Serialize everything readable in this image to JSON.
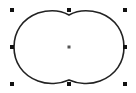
{
  "canvas": {
    "width": 136,
    "height": 93,
    "background": "#ffffff"
  },
  "shape": {
    "type": "union-of-two-circles",
    "stroke": "#222222",
    "stroke_width": 1.6,
    "fill": "#ffffff"
  },
  "selection": {
    "handle_color": "#111111",
    "handle_size": 4,
    "handles": [
      {
        "name": "top-left",
        "x": 12,
        "y": 10
      },
      {
        "name": "top-middle",
        "x": 69,
        "y": 10
      },
      {
        "name": "top-right",
        "x": 125,
        "y": 10
      },
      {
        "name": "middle-left",
        "x": 12,
        "y": 47
      },
      {
        "name": "middle-right",
        "x": 125,
        "y": 47
      },
      {
        "name": "bottom-left",
        "x": 12,
        "y": 84
      },
      {
        "name": "bottom-middle",
        "x": 69,
        "y": 84
      },
      {
        "name": "bottom-right",
        "x": 125,
        "y": 84
      }
    ],
    "center": {
      "x": 69,
      "y": 47
    }
  }
}
